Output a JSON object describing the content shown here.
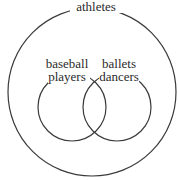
{
  "diagram": {
    "type": "venn",
    "universal_set": {
      "label": "athletes",
      "color": "#333333"
    },
    "sets": [
      {
        "label_line1": "baseball",
        "label_line2": "players"
      },
      {
        "label_line1": "ballets",
        "label_line2": "dancers"
      }
    ],
    "stroke_color": "#3a3a3a",
    "background": "#ffffff"
  }
}
